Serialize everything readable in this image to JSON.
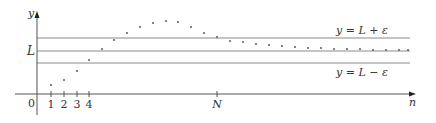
{
  "figure": {
    "axes": {
      "x_label": "n",
      "y_label": "y",
      "origin_label": "0"
    },
    "x_ticks": [
      {
        "label": "1",
        "x": 51
      },
      {
        "label": "2",
        "x": 64
      },
      {
        "label": "3",
        "x": 77
      },
      {
        "label": "4",
        "x": 89
      },
      {
        "label": "N",
        "x": 217
      }
    ],
    "lines": {
      "upper": {
        "label": "y = L + ε",
        "y": 38
      },
      "limit": {
        "label": "L",
        "y": 51
      },
      "lower": {
        "label": "y = L − ε",
        "y": 63
      }
    },
    "colors": {
      "axis": "#555555",
      "band_line": "#8a8a8a",
      "dot": "#666666",
      "text": "#333333"
    }
  },
  "chart_data": {
    "type": "scatter",
    "title": "",
    "xlabel": "n",
    "ylabel": "y",
    "grid": false,
    "annotations": [
      "L",
      "N",
      "y = L + ε",
      "y = L − ε",
      "0"
    ],
    "points_px": [
      [
        51,
        85
      ],
      [
        64,
        80
      ],
      [
        77,
        71
      ],
      [
        89,
        60
      ],
      [
        102,
        49
      ],
      [
        114,
        40
      ],
      [
        127,
        33
      ],
      [
        140,
        27
      ],
      [
        153,
        23
      ],
      [
        166,
        21
      ],
      [
        178,
        22
      ],
      [
        191,
        27
      ],
      [
        204,
        33
      ],
      [
        217,
        37
      ],
      [
        230,
        41
      ],
      [
        243,
        42
      ],
      [
        256,
        44
      ],
      [
        269,
        45
      ],
      [
        282,
        46
      ],
      [
        295,
        47
      ],
      [
        308,
        48
      ],
      [
        321,
        48
      ],
      [
        334,
        49
      ],
      [
        347,
        49
      ],
      [
        360,
        49
      ],
      [
        373,
        50
      ],
      [
        386,
        50
      ],
      [
        399,
        50
      ],
      [
        408,
        50
      ]
    ]
  }
}
